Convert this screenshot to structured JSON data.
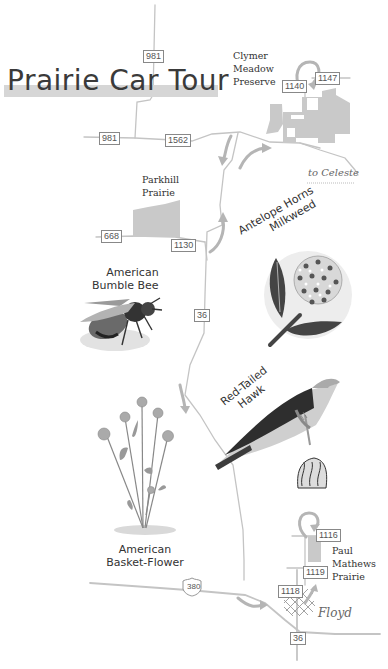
{
  "map": {
    "title": "Prairie Car Tour",
    "colors": {
      "road": "#c4c4c4",
      "arrow": "#b0b0b0",
      "preserve_fill": "#c9c9c9",
      "title_band": "#d6d6d6",
      "text": "#333333"
    }
  },
  "road_shields": [
    {
      "id": "981-north",
      "label": "981"
    },
    {
      "id": "981-west",
      "label": "981"
    },
    {
      "id": "1562",
      "label": "1562"
    },
    {
      "id": "1140",
      "label": "1140"
    },
    {
      "id": "1147",
      "label": "1147"
    },
    {
      "id": "668",
      "label": "668"
    },
    {
      "id": "1130",
      "label": "1130"
    },
    {
      "id": "36-mid",
      "label": "36"
    },
    {
      "id": "1116",
      "label": "1116"
    },
    {
      "id": "1119",
      "label": "1119"
    },
    {
      "id": "1118",
      "label": "1118"
    },
    {
      "id": "us-380",
      "label": "380"
    },
    {
      "id": "36-south",
      "label": "36"
    }
  ],
  "places": {
    "clymer": {
      "line1": "Clymer",
      "line2": "Meadow",
      "line3": "Preserve"
    },
    "parkhill": {
      "line1": "Parkhill",
      "line2": "Prairie"
    },
    "paul_mathews": {
      "line1": "Paul",
      "line2": "Mathews",
      "line3": "Prairie"
    },
    "to_celeste": "to Celeste",
    "floyd": "Floyd"
  },
  "species": {
    "milkweed": {
      "line1": "Antelope Horns",
      "line2": "Milkweed"
    },
    "bee": {
      "line1": "American",
      "line2": "Bumble Bee"
    },
    "hawk": {
      "line1": "Red-Tailed",
      "line2": "Hawk"
    },
    "basketflower": {
      "line1": "American",
      "line2": "Basket-Flower"
    }
  }
}
